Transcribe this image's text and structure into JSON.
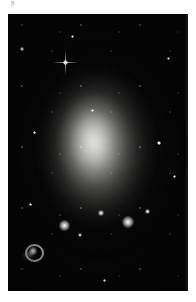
{
  "page": {
    "background_color": "#ffffff",
    "width": 196,
    "height": 302
  },
  "artifact": {
    "name": "scan-artifact",
    "description": "faint vertical pen-stroke mark at top-left margin"
  },
  "plate": {
    "label": "astronomical-photograph",
    "background_color": "#050505",
    "frame": {
      "left": 8,
      "top": 14,
      "width": 180,
      "height": 277
    },
    "subject": "dwarf irregular galaxy resolved into individual stars",
    "colors": {
      "sky": "#050505",
      "star": "#ffffff",
      "halo": "#ecece8",
      "knot": "#fafaf8"
    }
  },
  "galaxy": {
    "name": "galaxy-body",
    "center_x": 88,
    "center_y": 132,
    "halo_radius_x": 62,
    "halo_radius_y": 86,
    "core_brightness": 0.8
  },
  "objects": {
    "ring_nebula": {
      "name": "ring-nebula",
      "x": 14,
      "y": 229,
      "width": 22,
      "height": 19
    },
    "knots": [
      {
        "name": "hii-knot-1",
        "x": 56,
        "y": 211,
        "size": 11
      },
      {
        "name": "hii-knot-2",
        "x": 120,
        "y": 208,
        "size": 12
      },
      {
        "name": "hii-knot-3",
        "x": 93,
        "y": 199,
        "size": 6
      },
      {
        "name": "hii-knot-4",
        "x": 139,
        "y": 197,
        "size": 5
      },
      {
        "name": "hii-knot-5",
        "x": 72,
        "y": 221,
        "size": 4
      }
    ],
    "bright_stars": [
      {
        "name": "bright-star-spiked",
        "x": 57,
        "y": 48,
        "size": 5,
        "spikes": true
      },
      {
        "name": "bright-star-upper-left",
        "x": 14,
        "y": 35,
        "size": 4,
        "spikes": false
      },
      {
        "name": "bright-star-upper-mid",
        "x": 64,
        "y": 22,
        "size": 3,
        "spikes": false
      },
      {
        "name": "bright-star-right",
        "x": 151,
        "y": 129,
        "size": 4,
        "spikes": false
      },
      {
        "name": "bright-star-lower-right",
        "x": 166,
        "y": 162,
        "size": 3,
        "spikes": false
      },
      {
        "name": "bright-star-lower-left",
        "x": 22,
        "y": 190,
        "size": 3,
        "spikes": false
      },
      {
        "name": "bright-star-bottom",
        "x": 96,
        "y": 266,
        "size": 3,
        "spikes": false
      },
      {
        "name": "bright-star-mid-left",
        "x": 26,
        "y": 118,
        "size": 3,
        "spikes": false
      },
      {
        "name": "bright-star-top-right",
        "x": 160,
        "y": 44,
        "size": 3,
        "spikes": false
      },
      {
        "name": "bright-star-center",
        "x": 84,
        "y": 96,
        "size": 3,
        "spikes": false
      }
    ]
  }
}
